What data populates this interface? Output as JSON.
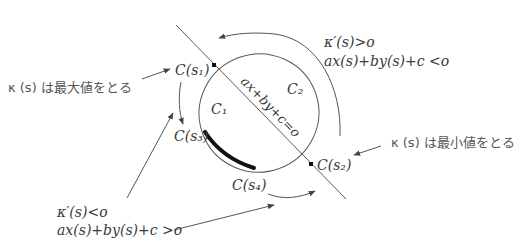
{
  "diagram": {
    "labels": {
      "c_s1": "C(s₁)",
      "c_s2": "C(s₂)",
      "c_s3": "C(s₃)",
      "c_s4": "C(s₄)",
      "c1": "C₁",
      "c2": "C₂",
      "line_equation": "ax+by+c=o"
    },
    "annotations": {
      "max_curvature": "κ (s) は最大値をとる",
      "min_curvature": "κ (s) は最小値をとる",
      "upper_right_line1": "κ′(s)>o",
      "upper_right_line2": "ax(s)+by(s)+c <o",
      "lower_left_line1": "κ′(s)<o",
      "lower_left_line2": "ax(s)+by(s)+c >o"
    },
    "colors": {
      "stroke": "#5a5a5a",
      "highlight_arc": "#111111",
      "text": "#3a3a3a"
    }
  }
}
